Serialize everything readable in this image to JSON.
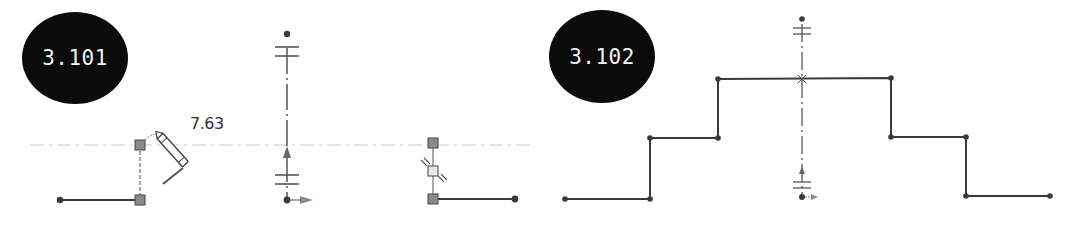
{
  "figures": [
    {
      "id": "3.101",
      "badge_label": "3.101",
      "panels": [
        {
          "name": "sketch-line-with-pencil",
          "dimension_value": "7.63",
          "description": "Horizontal line with vertical construction line being drawn by pencil cursor"
        },
        {
          "name": "centerline-with-symmetry",
          "description": "Vertical dash-dot centerline with symmetry markers and origin arrows"
        },
        {
          "name": "corner-with-midpoint-constraint",
          "description": "Horizontal line joined to vertical line with midpoint symmetry markers"
        }
      ]
    },
    {
      "id": "3.102",
      "badge_label": "3.102",
      "panels": [
        {
          "name": "stepped-profile-symmetric",
          "description": "Symmetric stepped profile about vertical centerline",
          "points": [
            [
              565,
              199
            ],
            [
              650,
              199
            ],
            [
              650,
              138
            ],
            [
              718,
              138
            ],
            [
              718,
              79
            ],
            [
              891,
              78
            ],
            [
              891,
              137
            ],
            [
              966,
              137
            ],
            [
              966,
              196
            ],
            [
              1050,
              196
            ]
          ]
        }
      ]
    }
  ],
  "colors": {
    "badge_bg": "#0b0b0b",
    "badge_text": "#f2f2f2",
    "line": "#3a3a3a",
    "construction": "#9a9a9a",
    "handle_fill": "#8a8a8a",
    "inference_line": "#e6e6e6"
  }
}
